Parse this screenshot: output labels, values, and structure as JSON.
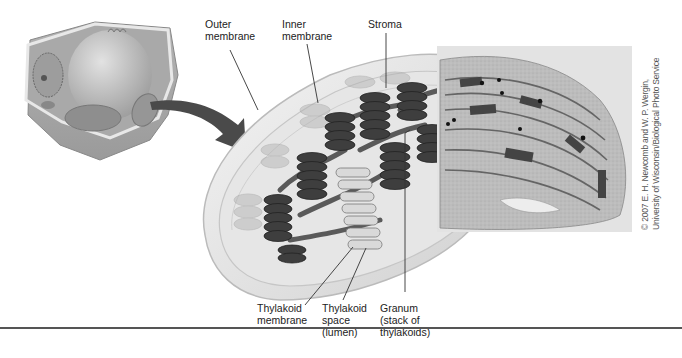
{
  "figure": {
    "labels": {
      "outer_membrane": "Outer\nmembrane",
      "inner_membrane": "Inner\nmembrane",
      "stroma": "Stroma",
      "thylakoid_membrane": "Thylakoid\nmembrane",
      "thylakoid_space": "Thylakoid\nspace\n(lumen)",
      "granum": "Granum\n(stack of\nthylakoids)"
    },
    "photo_credit": "© 2007 E. H. Newcomb and W. P. Wergin,\nUniversity of Wisconsin/Biological Photo Service",
    "panels": [
      "plant-cell-illustration",
      "chloroplast-cutaway-illustration",
      "electron-micrograph"
    ],
    "colors": {
      "background": "#ffffff",
      "ink": "#222222",
      "grana_dark": "#3a3a3a",
      "membrane_light": "#d8d8d8",
      "arrow": "#4a4a4a"
    }
  }
}
